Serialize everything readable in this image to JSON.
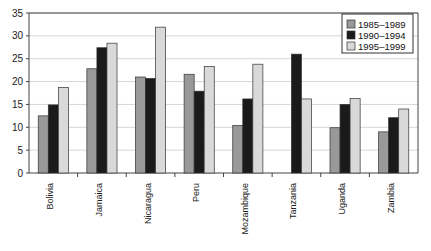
{
  "chart_data": {
    "type": "bar",
    "title": "",
    "subtitle": "",
    "xlabel": "",
    "ylabel": "",
    "ylim": [
      0,
      35
    ],
    "ytick_step": 5,
    "yticks": [
      "0",
      "5",
      "10",
      "15",
      "20",
      "25",
      "30",
      "35"
    ],
    "grid": true,
    "grid_axis": "y",
    "legend_position": "top-right",
    "categories": [
      "Bolivia",
      "Jamaica",
      "Nicaragua",
      "Peru",
      "Mozambique",
      "Tanzania",
      "Uganda",
      "Zambia"
    ],
    "series": [
      {
        "name": "1985–1989",
        "color": "#999999",
        "values": [
          12.5,
          22.8,
          21.0,
          21.6,
          10.4,
          null,
          9.9,
          9.0
        ]
      },
      {
        "name": "1990–1994",
        "color": "#1a1a1a",
        "values": [
          14.9,
          27.4,
          20.7,
          17.9,
          16.2,
          26.0,
          15.0,
          12.1
        ]
      },
      {
        "name": "1995–1999",
        "color": "#d9d9d9",
        "values": [
          18.7,
          28.4,
          31.9,
          23.3,
          23.8,
          16.2,
          16.3,
          14.0
        ]
      }
    ]
  },
  "colors": {
    "plot_border": "#444444",
    "gridline": "#cccccc",
    "bar_outline": "#333333",
    "background": "#ffffff",
    "legend_border": "#333333"
  },
  "axes": {
    "y_tick_marks": true,
    "x_tick_marks": true
  }
}
